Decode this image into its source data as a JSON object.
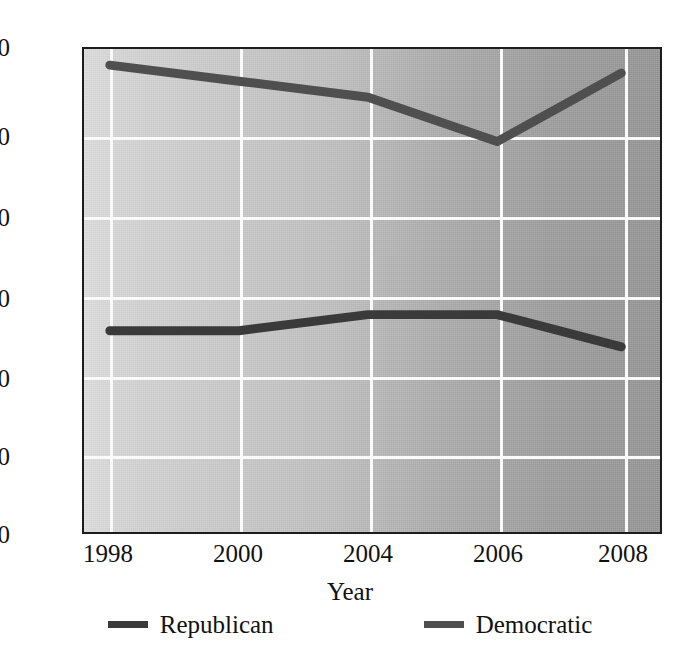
{
  "chart_data": {
    "type": "line",
    "title": "",
    "subtitle": "",
    "xlabel": "Year",
    "ylabel": "",
    "x": [
      1998,
      2000,
      2004,
      2006,
      2008
    ],
    "categories": [
      "1998",
      "2000",
      "2004",
      "2006",
      "2008"
    ],
    "xtick_labels": [
      "1998",
      "2000",
      "2004",
      "2006",
      "2008"
    ],
    "ytick_labels": [
      "0",
      "10",
      "20",
      "30",
      "40",
      "50",
      "60"
    ],
    "ylim": [
      0,
      60
    ],
    "yticks": [
      0,
      10,
      20,
      30,
      40,
      50,
      60
    ],
    "grid": true,
    "legend_position": "bottom",
    "series": [
      {
        "name": "Republican",
        "color": "#3a3a3a",
        "values": [
          25,
          25,
          27,
          27,
          23
        ]
      },
      {
        "name": "Democratic",
        "color": "#4f4f4f",
        "values": [
          58,
          56,
          54,
          48.5,
          57
        ]
      }
    ]
  },
  "axes": {
    "y_ticks": [
      {
        "label": "60",
        "value": 60
      },
      {
        "label": "50",
        "value": 50
      },
      {
        "label": "40",
        "value": 40
      },
      {
        "label": "30",
        "value": 30
      },
      {
        "label": "20",
        "value": 20
      },
      {
        "label": "10",
        "value": 10
      },
      {
        "label": "0",
        "value": 0
      }
    ],
    "x_ticks": [
      {
        "label": "1998",
        "value": 1998
      },
      {
        "label": "2000",
        "value": 2000
      },
      {
        "label": "2004",
        "value": 2004
      },
      {
        "label": "2006",
        "value": 2006
      },
      {
        "label": "2008",
        "value": 2008
      }
    ],
    "x_title": "Year"
  },
  "legend": {
    "items": [
      {
        "label": "Republican",
        "color": "#3a3a3a"
      },
      {
        "label": "Democratic",
        "color": "#4f4f4f"
      }
    ]
  },
  "colors": {
    "republican": "#3a3a3a",
    "democratic": "#4f4f4f",
    "gridline": "#fafafa",
    "axis": "#1c1c1c",
    "plot_bg_left": "#dcdcdc",
    "plot_bg_right": "#949494",
    "text": "#111111"
  }
}
